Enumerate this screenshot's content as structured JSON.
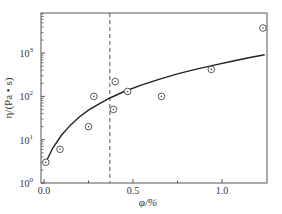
{
  "chart_data": {
    "type": "scatter",
    "title": "",
    "xlabel": "φ/%",
    "ylabel": "η/(Pa • s)",
    "xlim": [
      -0.02,
      1.25
    ],
    "ylim": [
      1,
      8000
    ],
    "yscale": "log",
    "grid": false,
    "legend": null,
    "x_ticks": [
      0.0,
      0.5,
      1.0
    ],
    "x_tick_labels": [
      "0.0",
      "0.5",
      "1.0"
    ],
    "y_ticks": [
      1,
      10,
      100,
      1000
    ],
    "y_tick_labels": [
      "10",
      "10",
      "10",
      "10"
    ],
    "y_tick_exponents": [
      "0",
      "1",
      "2",
      "3"
    ],
    "series": [
      {
        "name": "measured",
        "style": "circle-dot markers",
        "x": [
          0.01,
          0.09,
          0.25,
          0.28,
          0.39,
          0.4,
          0.47,
          0.66,
          0.94,
          1.23
        ],
        "y": [
          3,
          6,
          20,
          100,
          50,
          220,
          130,
          100,
          420,
          3800
        ]
      },
      {
        "name": "fit",
        "style": "solid line",
        "x": [
          0.01,
          0.05,
          0.1,
          0.15,
          0.2,
          0.25,
          0.3,
          0.37,
          0.45,
          0.55,
          0.65,
          0.75,
          0.85,
          0.95,
          1.05,
          1.15,
          1.24
        ],
        "y": [
          3,
          6.5,
          13,
          22,
          34,
          48,
          64,
          92,
          130,
          185,
          250,
          330,
          420,
          520,
          640,
          780,
          920
        ]
      }
    ],
    "annotations": [
      {
        "type": "vertical-dashed-line",
        "x": 0.37
      }
    ]
  }
}
